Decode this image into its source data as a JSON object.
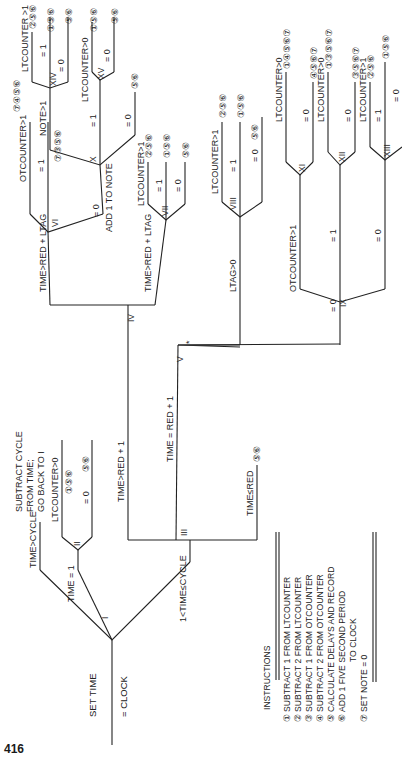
{
  "page_number": "416",
  "start": {
    "label_line1": "SET TIME",
    "label_line2": "= CLOCK"
  },
  "nodes": {
    "I": "I",
    "II": "II",
    "III": "III",
    "IV": "IV",
    "V": "V",
    "VI": "VI",
    "VII": "VII",
    "VIII": "VIII",
    "IX": "IX",
    "X": "X",
    "XI": "XI",
    "XII": "XII",
    "XIII": "XIII",
    "XIV": "XIV",
    "XV": "XV"
  },
  "branches": {
    "time_gt_cycle": "TIME>CYCLE",
    "subtract_cycle_1": "SUBTRACT CYCLE",
    "subtract_cycle_2": "FROM TIME;",
    "subtract_cycle_3": "GO BACK TO I",
    "time_eq_1": "TIME = 1",
    "one_lt_time_le_cycle": "1<TIME≤CYCLE",
    "ii_lt_gt0": "LTCOUNTER>0",
    "ii_eq0": "= 0",
    "time_gt_red1": "TIME>RED + 1",
    "time_eq_red1": "TIME = RED + 1",
    "time_le_red": "TIME≤RED",
    "iv_top": "TIME>RED + LTAG",
    "iv_bottom": "TIME>RED + LTAG",
    "vi_top": "OTCOUNTER>1",
    "vi_eq1": "= 1",
    "vi_eq0": "= 0",
    "add_note": "ADD 1 TO NOTE",
    "x_top": "NOTE>1",
    "x_eq1": "= 1",
    "x_eq0": "= 0",
    "xiv_top": "LTCOUNTER >1",
    "xiv_eq1": "= 1",
    "xiv_eq0": "= 0",
    "xv_top": "LTCOUNTER>0",
    "xv_eq0": "= 0",
    "vii_top": "LTCOUNTER>1",
    "vii_eq1": "= 1",
    "vii_eq0": "= 0",
    "v_top": "LTAG>0",
    "v_star": "*",
    "v_eq0": "= 0",
    "viii_top": "LTCOUNTER>1",
    "viii_eq1": "= 1",
    "viii_eq0": "= 0",
    "ix_top": "OTCOUNTER>1",
    "ix_eq1": "= 1",
    "ix_eq0": "= 0",
    "xi_top": "LTCOUNTER>0",
    "xi_eq0": "= 0",
    "xii_top": "LTCOUNTER>0",
    "xii_eq0": "= 0",
    "xiii_top": "LTCOUNTER>1",
    "xiii_eq1": "= 1",
    "xiii_eq0": "= 0"
  },
  "outcomes": {
    "ii_gt0": "①⑤⑥",
    "ii_eq0": "⑤⑥",
    "vi_gt1": "⑦④⑤⑥",
    "vi_eq1": "⑦③⑤⑥",
    "x_eq0": "⑤⑥",
    "xiv_gt1": "②⑤⑥",
    "xiv_eq1": "①⑤⑥",
    "xiv_eq0": "⑤⑥",
    "xv_gt0": "①⑤⑥",
    "xv_eq0": "⑤⑥",
    "vii_gt1": "②⑤⑥",
    "vii_eq1": "①⑤⑥",
    "vii_eq0": "⑤⑥",
    "viii_gt1": "②⑤⑥",
    "viii_eq1": "①⑤⑥",
    "viii_eq0": "⑤⑥",
    "xi_gt0": "①④⑤⑥⑦",
    "xi_eq0": "④⑤⑥⑦",
    "xii_gt0": "①③⑤⑥⑦",
    "xii_eq0": "③⑤⑥⑦",
    "xiii_gt1": "②⑤⑥",
    "xiii_eq1": "①⑤⑥",
    "time_le_red": "⑤⑥"
  },
  "instructions": {
    "title": "INSTRUCTIONS",
    "items": [
      {
        "num": "①",
        "text": "SUBTRACT 1 FROM LTCOUNTER"
      },
      {
        "num": "②",
        "text": "SUBTRACT 2 FROM LTCOUNTER"
      },
      {
        "num": "③",
        "text": "SUBTRACT 1 FROM OTCOUNTER"
      },
      {
        "num": "④",
        "text": "SUBTRACT 2 FROM OTCOUNTER"
      },
      {
        "num": "⑤",
        "text": "CALCULATE DELAYS AND RECORD"
      },
      {
        "num": "⑥",
        "text": "ADD 1 FIVE SECOND PERIOD"
      },
      {
        "num": "",
        "text": "TO CLOCK"
      },
      {
        "num": "⑦",
        "text": "SET NOTE = 0"
      }
    ]
  }
}
